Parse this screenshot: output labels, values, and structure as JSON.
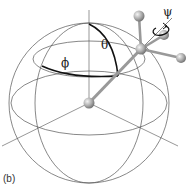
{
  "figure": {
    "panel_label": "(b)",
    "angles": {
      "theta": "θ",
      "phi": "ϕ",
      "psi": "ψ"
    }
  },
  "colors": {
    "wire": "#555555",
    "bold_arc": "#111111",
    "axis": "#666666",
    "rod": "#9a9a9a",
    "ball_light": "#eeeeee",
    "ball_dark": "#7a7a7a"
  }
}
